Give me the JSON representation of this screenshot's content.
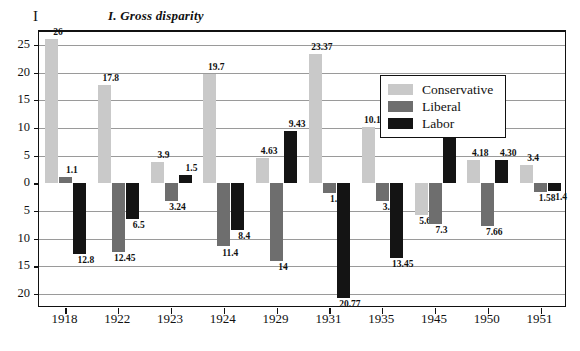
{
  "title": "I. Gross disparity",
  "yaxis_letter": "I",
  "legend": {
    "items": [
      {
        "label": "Conservative",
        "color": "#c9c9c9",
        "key": "conservative"
      },
      {
        "label": "Liberal",
        "color": "#6e6e6e",
        "key": "liberal"
      },
      {
        "label": "Labor",
        "color": "#141414",
        "key": "labor"
      }
    ]
  },
  "chart_data": {
    "type": "bar",
    "title": "I. Gross disparity",
    "xlabel": "",
    "ylabel": "I",
    "ylim": [
      -22.5,
      27.5
    ],
    "grid": true,
    "legend_position": "top-right-inside",
    "axis_tick_labels": [
      "25",
      "20",
      "15",
      "10",
      "5",
      "0",
      "5",
      "10",
      "15",
      "20"
    ],
    "axis_tick_values": [
      25,
      20,
      15,
      10,
      5,
      0,
      -5,
      -10,
      -15,
      -20
    ],
    "note": "Negative axis tick labels are drawn without a minus sign; bar value labels are also unsigned.",
    "categories": [
      "1918",
      "1922",
      "1923",
      "1924",
      "1929",
      "1931",
      "1935",
      "1945",
      "1950",
      "1951"
    ],
    "series": [
      {
        "name": "Conservative",
        "color": "#c9c9c9",
        "values": [
          26,
          17.8,
          3.9,
          19.7,
          4.63,
          23.37,
          10.17,
          -5.64,
          4.18,
          3.4
        ],
        "labels": [
          "26",
          "17.8",
          "3.9",
          "19.7",
          "4.63",
          "23.37",
          "10.17",
          "5.64",
          "4.18",
          "3.4"
        ]
      },
      {
        "name": "Liberal",
        "color": "#6e6e6e",
        "values": [
          1.1,
          -12.45,
          -3.24,
          -11.4,
          -14,
          -1.8,
          -3.1,
          -7.3,
          -7.66,
          -1.58
        ],
        "labels": [
          "1.1",
          "12.45",
          "3.24",
          "11.4",
          "14",
          "1.8",
          "3.1",
          "7.3",
          "7.66",
          "1.58"
        ]
      },
      {
        "name": "Labor",
        "color": "#141414",
        "values": [
          -12.8,
          -6.5,
          1.5,
          -8.4,
          9.43,
          -20.77,
          -13.45,
          13,
          4.3,
          -1.4
        ],
        "labels": [
          "12.8",
          "6.5",
          "1.5",
          "8.4",
          "9.43",
          "20.77",
          "13.45",
          "13",
          "4.30",
          "1.4"
        ]
      }
    ]
  }
}
